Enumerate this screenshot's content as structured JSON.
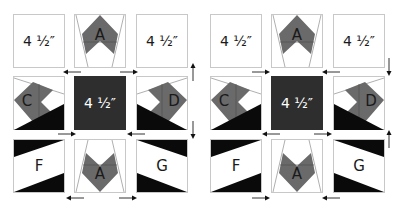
{
  "colors": {
    "background": "#ffffff",
    "border": "#c8c8c8",
    "medium": "#6a6a6a",
    "dark": "#2e2e2e",
    "black": "#0a0a0a",
    "line": "#9a9a9a"
  },
  "panels": [
    {
      "id": "left",
      "blocks": {
        "top_left": "4 ½″",
        "top_center": "A",
        "top_right": "4 ½″",
        "middle_left": "C",
        "center": "4 ½″",
        "middle_right": "D",
        "bottom_left": "F",
        "bottom_center": "A",
        "bottom_right": "G"
      },
      "arrows": [
        {
          "position": "row1-gap-left",
          "direction": "left"
        },
        {
          "position": "row1-gap-right",
          "direction": "right"
        },
        {
          "position": "right-side-top",
          "direction": "up"
        },
        {
          "position": "row2-gap-left",
          "direction": "right"
        },
        {
          "position": "row2-gap-right",
          "direction": "left"
        },
        {
          "position": "right-side-bottom",
          "direction": "down"
        },
        {
          "position": "row3-gap-left",
          "direction": "left"
        },
        {
          "position": "row3-gap-right",
          "direction": "right"
        }
      ]
    },
    {
      "id": "right",
      "blocks": {
        "top_left": "4 ½″",
        "top_center": "A",
        "top_right": "4 ½″",
        "middle_left": "C",
        "center": "4 ½″",
        "middle_right": "D",
        "bottom_left": "F",
        "bottom_center": "A",
        "bottom_right": "G"
      },
      "arrows": [
        {
          "position": "row1-gap-left",
          "direction": "right"
        },
        {
          "position": "row1-gap-right",
          "direction": "left"
        },
        {
          "position": "right-side-top",
          "direction": "down"
        },
        {
          "position": "row2-gap-left",
          "direction": "left"
        },
        {
          "position": "row2-gap-right",
          "direction": "right"
        },
        {
          "position": "right-side-bottom",
          "direction": "up"
        },
        {
          "position": "row3-gap-left",
          "direction": "right"
        },
        {
          "position": "row3-gap-right",
          "direction": "left"
        }
      ]
    }
  ]
}
